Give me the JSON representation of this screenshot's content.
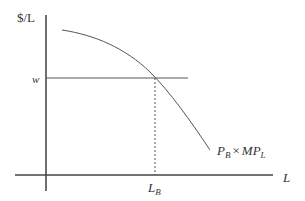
{
  "diagram": {
    "type": "labor-demand",
    "y_axis_label": "$/L",
    "x_axis_label": "L",
    "wage_label": "w",
    "equilibrium_label": {
      "main": "L",
      "sub": "B"
    },
    "curve_label": {
      "p": "P",
      "p_sub": "B",
      "times": "×",
      "mp": "MP",
      "mp_sub": "L"
    },
    "colors": {
      "axis": "#222222",
      "line": "#555555",
      "text": "#333333"
    }
  }
}
